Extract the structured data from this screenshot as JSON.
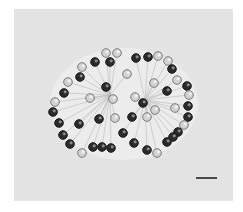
{
  "image": {
    "type": "phase-contrast micrograph",
    "subject": "spherical colonial microorganism with peripheral cells on stalks",
    "background_color": "#e3e3e3"
  },
  "colony": {
    "halo_color": "#efefef",
    "stalk_color": "#b9b9b9",
    "cells": [
      {
        "x": 106,
        "y": 53,
        "dark": false
      },
      {
        "x": 117,
        "y": 53,
        "dark": false
      },
      {
        "x": 95,
        "y": 62,
        "dark": true
      },
      {
        "x": 110,
        "y": 62,
        "dark": true
      },
      {
        "x": 136,
        "y": 58,
        "dark": true
      },
      {
        "x": 148,
        "y": 57,
        "dark": true
      },
      {
        "x": 158,
        "y": 56,
        "dark": false
      },
      {
        "x": 168,
        "y": 61,
        "dark": false
      },
      {
        "x": 172,
        "y": 69,
        "dark": true
      },
      {
        "x": 177,
        "y": 80,
        "dark": false
      },
      {
        "x": 82,
        "y": 67,
        "dark": false
      },
      {
        "x": 80,
        "y": 77,
        "dark": true
      },
      {
        "x": 68,
        "y": 82,
        "dark": false
      },
      {
        "x": 64,
        "y": 93,
        "dark": true
      },
      {
        "x": 127,
        "y": 74,
        "dark": false
      },
      {
        "x": 106,
        "y": 87,
        "dark": true
      },
      {
        "x": 154,
        "y": 83,
        "dark": false
      },
      {
        "x": 167,
        "y": 91,
        "dark": true
      },
      {
        "x": 187,
        "y": 86,
        "dark": true
      },
      {
        "x": 189,
        "y": 95,
        "dark": false
      },
      {
        "x": 90,
        "y": 98,
        "dark": false
      },
      {
        "x": 113,
        "y": 99,
        "dark": false
      },
      {
        "x": 135,
        "y": 97,
        "dark": false
      },
      {
        "x": 143,
        "y": 103,
        "dark": true
      },
      {
        "x": 155,
        "y": 110,
        "dark": false
      },
      {
        "x": 55,
        "y": 102,
        "dark": false
      },
      {
        "x": 53,
        "y": 112,
        "dark": true
      },
      {
        "x": 59,
        "y": 123,
        "dark": true
      },
      {
        "x": 79,
        "y": 124,
        "dark": true
      },
      {
        "x": 99,
        "y": 119,
        "dark": true
      },
      {
        "x": 115,
        "y": 118,
        "dark": false
      },
      {
        "x": 132,
        "y": 117,
        "dark": true
      },
      {
        "x": 147,
        "y": 117,
        "dark": false
      },
      {
        "x": 175,
        "y": 108,
        "dark": false
      },
      {
        "x": 188,
        "y": 106,
        "dark": true
      },
      {
        "x": 188,
        "y": 117,
        "dark": true
      },
      {
        "x": 184,
        "y": 125,
        "dark": false
      },
      {
        "x": 178,
        "y": 132,
        "dark": true
      },
      {
        "x": 63,
        "y": 135,
        "dark": true
      },
      {
        "x": 70,
        "y": 144,
        "dark": true
      },
      {
        "x": 82,
        "y": 153,
        "dark": false
      },
      {
        "x": 123,
        "y": 133,
        "dark": true
      },
      {
        "x": 134,
        "y": 143,
        "dark": true
      },
      {
        "x": 93,
        "y": 147,
        "dark": true
      },
      {
        "x": 102,
        "y": 147,
        "dark": true
      },
      {
        "x": 111,
        "y": 148,
        "dark": true
      },
      {
        "x": 147,
        "y": 150,
        "dark": true
      },
      {
        "x": 157,
        "y": 153,
        "dark": false
      },
      {
        "x": 167,
        "y": 142,
        "dark": true
      },
      {
        "x": 173,
        "y": 137,
        "dark": true
      }
    ],
    "centers": [
      {
        "x": 110,
        "y": 95
      },
      {
        "x": 145,
        "y": 100
      }
    ]
  },
  "scale_bar": {
    "x1": 196,
    "x2": 217,
    "y": 177,
    "color": "#4a4a4a",
    "label": ""
  }
}
